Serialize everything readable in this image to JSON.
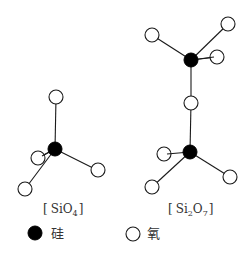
{
  "structures": [
    {
      "name": "SiO4",
      "label": {
        "open": "[",
        "main": "SiO",
        "sub": "4",
        "close": "]"
      }
    },
    {
      "name": "Si2O7",
      "label": {
        "open": "[",
        "main1": "Si",
        "sub1": "2",
        "main2": "O",
        "sub2": "7",
        "close": "]"
      }
    }
  ],
  "legend": {
    "silicon": {
      "symbol": "filled-circle",
      "text": "硅"
    },
    "oxygen": {
      "symbol": "open-circle",
      "text": "氧"
    }
  },
  "colors": {
    "silicon_fill": "#000000",
    "oxygen_fill": "#ffffff",
    "line": "#1a1a1a",
    "text": "#333333"
  }
}
